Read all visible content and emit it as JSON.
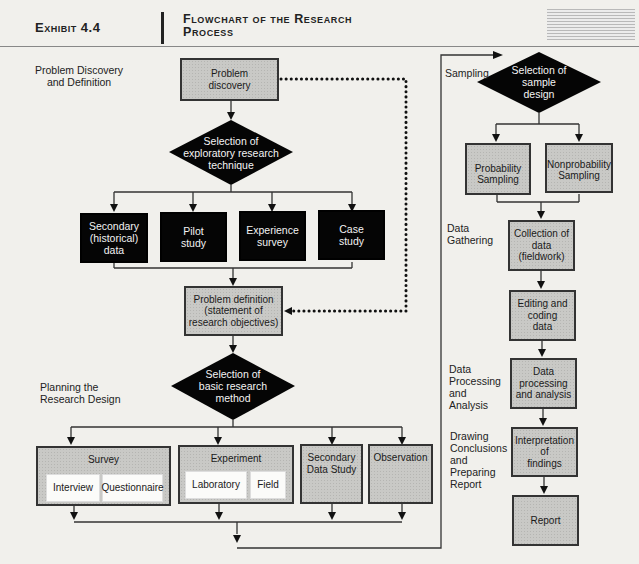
{
  "header": {
    "exhibit": "Exhibit 4.4",
    "title_line1": "Flowchart of the Research",
    "title_line2": "Process"
  },
  "stages": {
    "problem_discovery": [
      "Problem Discovery",
      "and Definition"
    ],
    "planning": [
      "Planning the",
      "Research Design"
    ],
    "sampling": [
      "Sampling"
    ],
    "data_gathering": [
      "Data",
      "Gathering"
    ],
    "data_processing": [
      "Data",
      "Processing",
      "and",
      "Analysis"
    ],
    "conclusions": [
      "Drawing",
      "Conclusions",
      "and",
      "Preparing",
      "Report"
    ]
  },
  "nodes": {
    "problem_discovery": [
      "Problem",
      "discovery"
    ],
    "exploratory_decision": [
      "Selection of",
      "exploratory research",
      "technique"
    ],
    "exploratory_options": [
      [
        "Secondary",
        "(historical)",
        "data"
      ],
      [
        "Pilot",
        "study"
      ],
      [
        "Experience",
        "survey"
      ],
      [
        "Case",
        "study"
      ]
    ],
    "problem_definition": [
      "Problem definition",
      "(statement of",
      "research objectives)"
    ],
    "method_decision": [
      "Selection of",
      "basic research",
      "method"
    ],
    "methods": {
      "survey": {
        "label": "Survey",
        "subs": [
          "Interview",
          "Questionnaire"
        ]
      },
      "experiment": {
        "label": "Experiment",
        "subs": [
          "Laboratory",
          "Field"
        ]
      },
      "secondary_data_study": [
        "Secondary",
        "Data Study"
      ],
      "observation": "Observation"
    },
    "sample_decision": [
      "Selection of",
      "sample",
      "design"
    ],
    "sampling_options": [
      [
        "Probability",
        "Sampling"
      ],
      [
        "Nonprobability",
        "Sampling"
      ]
    ],
    "collection": [
      "Collection of",
      "data",
      "(fieldwork)"
    ],
    "editing": [
      "Editing and",
      "coding",
      "data"
    ],
    "processing": [
      "Data",
      "processing",
      "and analysis"
    ],
    "interpretation": [
      "Interpretation",
      "of",
      "findings"
    ],
    "report": "Report"
  },
  "colors": {
    "process_box": "#c9c9c6",
    "decision_fill": "#050505",
    "exploratory_box": "#050505",
    "line": "#333333",
    "background": "#f1f0ec"
  }
}
